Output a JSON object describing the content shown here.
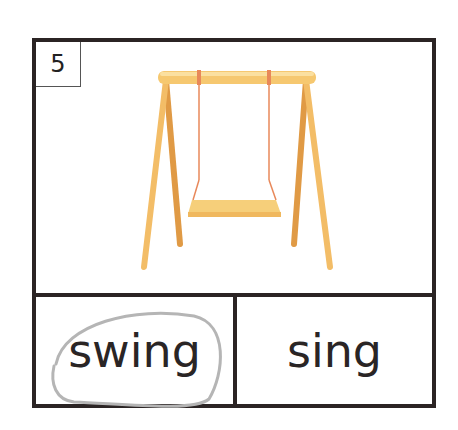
{
  "card": {
    "number": "5",
    "picture": "swing-icon",
    "options": [
      {
        "word": "swing",
        "circled": true
      },
      {
        "word": "sing",
        "circled": false
      }
    ]
  },
  "colors": {
    "border": "#2b2424",
    "wood": "#f5c46a",
    "wood_dark": "#e9a54a",
    "rope": "#e8885a",
    "circle": "#b5b5b5"
  }
}
